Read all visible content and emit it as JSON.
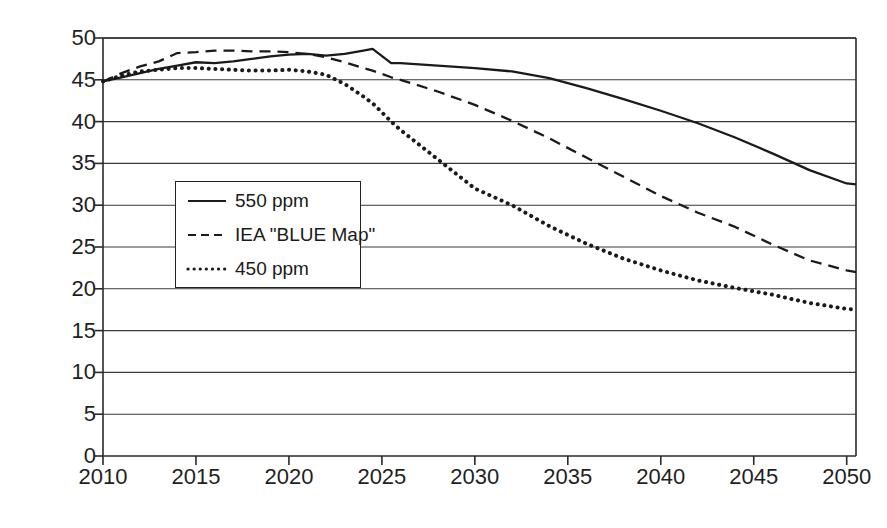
{
  "chart_data": {
    "type": "line",
    "title": "",
    "xlabel": "",
    "ylabel": "GtCO2-e",
    "ylabel_parts": {
      "pre": "GtCO",
      "sub": "2",
      "post": "-e"
    },
    "xlim": [
      2010,
      2050.5
    ],
    "ylim": [
      0,
      50
    ],
    "xticks": [
      2010,
      2015,
      2020,
      2025,
      2030,
      2035,
      2040,
      2045,
      2050
    ],
    "yticks": [
      0,
      5,
      10,
      15,
      20,
      25,
      30,
      35,
      40,
      45,
      50
    ],
    "grid": "horizontal",
    "legend_position": "inside-left-middle",
    "x": [
      2010,
      2011,
      2012,
      2013,
      2014,
      2015,
      2016,
      2017,
      2018,
      2019,
      2020,
      2021,
      2022,
      2023,
      2024,
      2024.5,
      2025.5,
      2026,
      2028,
      2030,
      2032,
      2034,
      2036,
      2038,
      2040,
      2042,
      2044,
      2046,
      2048,
      2050,
      2050.5
    ],
    "series": [
      {
        "name": "550 ppm",
        "style": "solid",
        "color": "#1a1a1a",
        "values": [
          44.8,
          45.3,
          45.8,
          46.3,
          46.7,
          47.1,
          47.0,
          47.2,
          47.5,
          47.8,
          48.0,
          48.1,
          47.9,
          48.1,
          48.5,
          48.7,
          47.0,
          47.0,
          46.7,
          46.4,
          46.0,
          45.2,
          44.0,
          42.7,
          41.3,
          39.8,
          38.1,
          36.2,
          34.2,
          32.6,
          32.5
        ]
      },
      {
        "name": "IEA \"BLUE Map\"",
        "style": "dashed",
        "color": "#1a1a1a",
        "values": [
          44.8,
          45.8,
          46.6,
          47.2,
          48.2,
          48.3,
          48.5,
          48.5,
          48.4,
          48.4,
          48.3,
          48.1,
          47.7,
          47.1,
          46.4,
          46.1,
          45.3,
          45.0,
          43.6,
          42.0,
          40.1,
          38.0,
          35.7,
          33.4,
          31.1,
          29.1,
          27.4,
          25.3,
          23.4,
          22.2,
          22.0
        ]
      },
      {
        "name": "450 ppm",
        "style": "dotted",
        "color": "#1a1a1a",
        "values": [
          44.8,
          45.5,
          46.0,
          46.2,
          46.4,
          46.4,
          46.3,
          46.2,
          46.1,
          46.1,
          46.2,
          46.0,
          45.6,
          44.5,
          43.0,
          42.2,
          40.0,
          39.0,
          35.5,
          32.0,
          30.0,
          27.5,
          25.4,
          23.6,
          22.2,
          21.0,
          20.1,
          19.3,
          18.3,
          17.6,
          17.5
        ]
      }
    ]
  },
  "legend": {
    "items": [
      {
        "label": "550 ppm",
        "style": "solid"
      },
      {
        "label": "IEA \"BLUE Map\"",
        "style": "dashed"
      },
      {
        "label": "450 ppm",
        "style": "dotted"
      }
    ]
  }
}
